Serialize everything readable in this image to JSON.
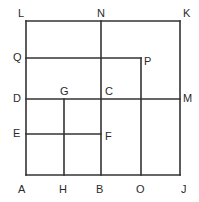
{
  "figure": {
    "type": "line-diagram",
    "canvas": {
      "width": 199,
      "height": 202
    },
    "style": {
      "stroke_color": "#333333",
      "background_color": "#ffffff",
      "label_color": "#2b2b2b",
      "stroke_width": 1.6,
      "label_font_size": 11
    },
    "grid": {
      "x_coords": {
        "left": 26,
        "h_line": 64,
        "mid": 101,
        "o_line": 141,
        "right": 180
      },
      "y_coords": {
        "top": 21,
        "q_line": 58,
        "d_line": 99,
        "e_line": 134,
        "bottom": 175
      }
    },
    "points": [
      {
        "id": "L",
        "label": "L",
        "x": 26,
        "y": 21,
        "label_x": 18,
        "label_y": 8
      },
      {
        "id": "N",
        "label": "N",
        "x": 101,
        "y": 21,
        "label_x": 97,
        "label_y": 8
      },
      {
        "id": "K",
        "label": "K",
        "x": 180,
        "y": 21,
        "label_x": 183,
        "label_y": 8
      },
      {
        "id": "Q",
        "label": "Q",
        "x": 26,
        "y": 58,
        "label_x": 13,
        "label_y": 52
      },
      {
        "id": "P",
        "label": "P",
        "x": 141,
        "y": 58,
        "label_x": 144,
        "label_y": 56
      },
      {
        "id": "D",
        "label": "D",
        "x": 26,
        "y": 99,
        "label_x": 13,
        "label_y": 93
      },
      {
        "id": "G",
        "label": "G",
        "x": 64,
        "y": 99,
        "label_x": 60,
        "label_y": 86
      },
      {
        "id": "C",
        "label": "C",
        "x": 101,
        "y": 99,
        "label_x": 105,
        "label_y": 86
      },
      {
        "id": "M",
        "label": "M",
        "x": 180,
        "y": 99,
        "label_x": 183,
        "label_y": 93
      },
      {
        "id": "E",
        "label": "E",
        "x": 26,
        "y": 134,
        "label_x": 13,
        "label_y": 128
      },
      {
        "id": "F",
        "label": "F",
        "x": 101,
        "y": 134,
        "label_x": 105,
        "label_y": 131
      },
      {
        "id": "A",
        "label": "A",
        "x": 26,
        "y": 175,
        "label_x": 18,
        "label_y": 184
      },
      {
        "id": "H",
        "label": "H",
        "x": 64,
        "y": 175,
        "label_x": 59,
        "label_y": 184
      },
      {
        "id": "B",
        "label": "B",
        "x": 101,
        "y": 175,
        "label_x": 96,
        "label_y": 184
      },
      {
        "id": "O",
        "label": "O",
        "x": 141,
        "y": 175,
        "label_x": 136,
        "label_y": 184
      },
      {
        "id": "J",
        "label": "J",
        "x": 180,
        "y": 175,
        "label_x": 181,
        "label_y": 184
      }
    ],
    "segments": [
      {
        "name": "segment-L-K-top-edge",
        "from": "L",
        "to": "K",
        "x1": 26,
        "y1": 21,
        "x2": 180,
        "y2": 21
      },
      {
        "name": "segment-A-J-bottom-edge",
        "from": "A",
        "to": "J",
        "x1": 26,
        "y1": 175,
        "x2": 180,
        "y2": 175
      },
      {
        "name": "segment-L-A-left-edge",
        "from": "L",
        "to": "A",
        "x1": 26,
        "y1": 21,
        "x2": 26,
        "y2": 175
      },
      {
        "name": "segment-K-J-right-edge",
        "from": "K",
        "to": "J",
        "x1": 180,
        "y1": 21,
        "x2": 180,
        "y2": 175
      },
      {
        "name": "segment-Q-P-horizontal",
        "from": "Q",
        "to": "P",
        "x1": 26,
        "y1": 58,
        "x2": 141,
        "y2": 58
      },
      {
        "name": "segment-D-M-horizontal",
        "from": "D",
        "to": "M",
        "x1": 26,
        "y1": 99,
        "x2": 180,
        "y2": 99
      },
      {
        "name": "segment-E-F-horizontal",
        "from": "E",
        "to": "F",
        "x1": 26,
        "y1": 134,
        "x2": 101,
        "y2": 134
      },
      {
        "name": "segment-N-B-vertical",
        "from": "N",
        "to": "B",
        "x1": 101,
        "y1": 21,
        "x2": 101,
        "y2": 175
      },
      {
        "name": "segment-P-O-vertical",
        "from": "P",
        "to": "O",
        "x1": 141,
        "y1": 58,
        "x2": 141,
        "y2": 175
      },
      {
        "name": "segment-G-H-vertical",
        "from": "G",
        "to": "H",
        "x1": 64,
        "y1": 99,
        "x2": 64,
        "y2": 175
      }
    ]
  }
}
